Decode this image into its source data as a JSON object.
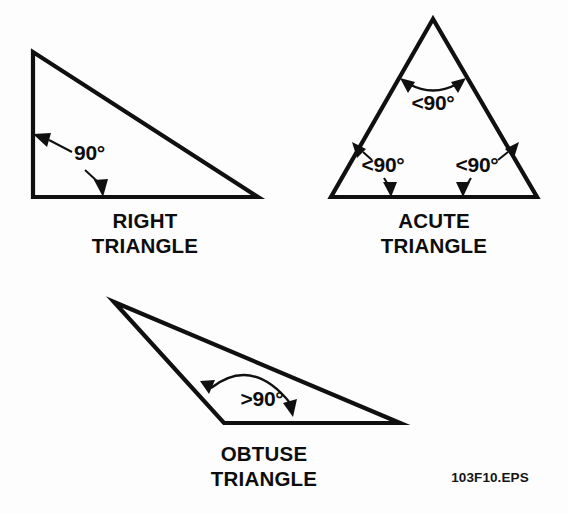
{
  "figure": {
    "id_label": "103F10.EPS",
    "background_color": "#fdfdfd",
    "ink_color": "#101010"
  },
  "shapes": [
    {
      "key": "right",
      "caption_line1": "RIGHT",
      "caption_line2": "TRIANGLE",
      "vertices": [
        [
          33,
          52
        ],
        [
          33,
          197
        ],
        [
          258,
          197
        ]
      ],
      "angle_labels": [
        {
          "key": "right-90",
          "text": "90°",
          "x": 74,
          "y": 160,
          "anchor": "start"
        }
      ]
    },
    {
      "key": "acute",
      "caption_line1": "ACUTE",
      "caption_line2": "TRIANGLE",
      "vertices": [
        [
          433,
          19
        ],
        [
          331,
          197
        ],
        [
          537,
          197
        ]
      ],
      "angle_labels": [
        {
          "key": "acute-top",
          "text": "<90°",
          "x": 433,
          "y": 110,
          "anchor": "middle"
        },
        {
          "key": "acute-bottom-left",
          "text": "<90°",
          "x": 383,
          "y": 172,
          "anchor": "middle"
        },
        {
          "key": "acute-bottom-right",
          "text": "<90°",
          "x": 477,
          "y": 172,
          "anchor": "middle"
        }
      ]
    },
    {
      "key": "obtuse",
      "caption_line1": "OBTUSE",
      "caption_line2": "TRIANGLE",
      "vertices": [
        [
          114,
          302
        ],
        [
          224,
          423
        ],
        [
          400,
          423
        ]
      ],
      "angle_labels": [
        {
          "key": "obtuse-90",
          "text": ">90°",
          "x": 262,
          "y": 406,
          "anchor": "middle"
        }
      ]
    }
  ],
  "captions": {
    "right": {
      "x": 145,
      "line1_y": 228,
      "line2_y": 253
    },
    "acute": {
      "x": 434,
      "line1_y": 228,
      "line2_y": 253
    },
    "obtuse": {
      "x": 264,
      "line1_y": 461,
      "line2_y": 486
    }
  },
  "figure_id_position": {
    "x": 490,
    "y": 482
  }
}
